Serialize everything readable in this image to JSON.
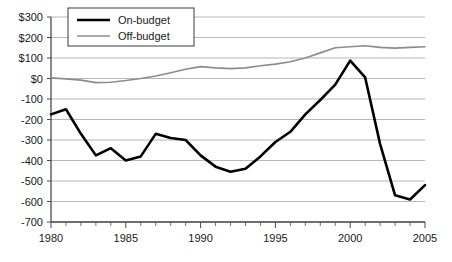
{
  "chart_data": {
    "type": "line",
    "title": "",
    "subtitle": "",
    "xlabel": "",
    "ylabel": "",
    "xlim": [
      1980,
      2005
    ],
    "ylim": [
      -700,
      300
    ],
    "grid": true,
    "legend_position": "top-left",
    "y_ticks": [
      300,
      200,
      100,
      0,
      -100,
      -200,
      -300,
      -400,
      -500,
      -600,
      -700
    ],
    "y_tick_labels": [
      "$300",
      "$200",
      "$100",
      "$0",
      "-100",
      "-200",
      "-300",
      "-400",
      "-500",
      "-600",
      "-700"
    ],
    "x_ticks": [
      1980,
      1985,
      1990,
      1995,
      2000,
      2005
    ],
    "x_tick_labels": [
      "1980",
      "1985",
      "1990",
      "1995",
      "2000",
      "2005"
    ],
    "x_minor_tick_step": 1,
    "x": [
      1980,
      1981,
      1982,
      1983,
      1984,
      1985,
      1986,
      1987,
      1988,
      1989,
      1990,
      1991,
      1992,
      1993,
      1994,
      1995,
      1996,
      1997,
      1998,
      1999,
      2000,
      2001,
      2002,
      2003,
      2004,
      2005
    ],
    "series": [
      {
        "name": "On-budget",
        "color": "#000000",
        "line_width": 2.6,
        "values": [
          -175,
          -150,
          -270,
          -375,
          -340,
          -400,
          -380,
          -270,
          -290,
          -300,
          -375,
          -430,
          -455,
          -440,
          -380,
          -310,
          -260,
          -175,
          -105,
          -30,
          87,
          5,
          -320,
          -570,
          -590,
          -520
        ]
      },
      {
        "name": "Off-budget",
        "color": "#8c8c8c",
        "line_width": 1.6,
        "values": [
          3,
          -2,
          -8,
          -20,
          -18,
          -10,
          0,
          12,
          28,
          45,
          58,
          52,
          48,
          52,
          62,
          70,
          82,
          100,
          125,
          150,
          155,
          160,
          152,
          148,
          152,
          155
        ]
      }
    ]
  },
  "legend": {
    "entries": [
      {
        "label": "On-budget"
      },
      {
        "label": "Off-budget"
      }
    ]
  }
}
